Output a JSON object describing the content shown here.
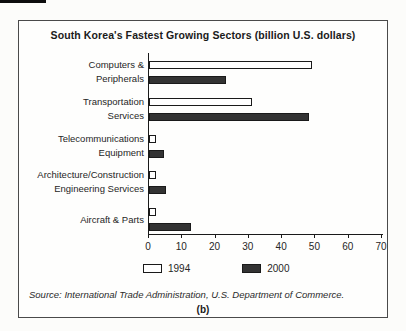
{
  "chart_data": {
    "type": "bar",
    "orientation": "horizontal",
    "title": "South Korea's Fastest Growing Sectors (billion U.S. dollars)",
    "value_unit": "billion U.S. dollars",
    "categories": [
      "Computers & Peripherals",
      "Transportation Services",
      "Telecommunications Equipment",
      "Architecture/Construction Engineering Services",
      "Aircraft & Parts"
    ],
    "category_label_lines": [
      [
        "Computers &",
        "Peripherals"
      ],
      [
        "Transportation",
        "Services"
      ],
      [
        "Telecommunications",
        "Equipment"
      ],
      [
        "Architecture/Construction",
        "Engineering Services"
      ],
      [
        "Aircraft & Parts"
      ]
    ],
    "series": [
      {
        "name": "1994",
        "color": "#ffffff",
        "values": [
          49,
          31,
          2,
          2,
          2
        ]
      },
      {
        "name": "2000",
        "color": "#333333",
        "values": [
          23,
          48,
          4.5,
          5,
          12.5
        ]
      }
    ],
    "xlim": [
      0,
      70
    ],
    "xticks": [
      0,
      10,
      20,
      30,
      40,
      50,
      60,
      70
    ],
    "grid": false,
    "legend_position": "bottom",
    "bar_outline_color": "#1a1a1a",
    "source": "Source: International Trade Administration, U.S. Department of Commerce.",
    "panel_label": "(b)"
  }
}
